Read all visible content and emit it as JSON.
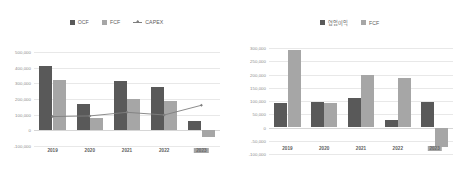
{
  "chart_data": [
    {
      "type": "bar",
      "title": "",
      "xlabel": "",
      "ylabel": "",
      "categories": [
        "2019",
        "2020",
        "2021",
        "2022",
        "2023"
      ],
      "highlight_category": "2023",
      "ylim": [
        -100000,
        500000
      ],
      "yticks": [
        "500,000",
        "400,000",
        "300,000",
        "200,000",
        "100,000",
        "0",
        "-100,000"
      ],
      "ytick_values": [
        500000,
        400000,
        300000,
        200000,
        100000,
        0,
        -100000
      ],
      "grid": true,
      "legend_position": "top-center",
      "series": [
        {
          "name": "OCF",
          "kind": "bar",
          "color": "#595959",
          "values": [
            408000,
            168000,
            318000,
            278000,
            58000
          ]
        },
        {
          "name": "FCF",
          "kind": "bar",
          "color": "#a6a6a6",
          "values": [
            320000,
            78000,
            200000,
            190000,
            -45000
          ]
        },
        {
          "name": "CAPEX",
          "kind": "line",
          "color": "#7f7f7f",
          "values": [
            88000,
            92000,
            115000,
            98000,
            160000
          ]
        }
      ]
    },
    {
      "type": "bar",
      "title": "",
      "xlabel": "",
      "ylabel": "",
      "categories": [
        "2019",
        "2020",
        "2021",
        "2022",
        "2023"
      ],
      "highlight_category": "2023",
      "ylim": [
        -100000,
        300000
      ],
      "yticks": [
        "300,000",
        "250,000",
        "200,000",
        "150,000",
        "100,000",
        "50,000",
        "0",
        "-50,000",
        "-100,000"
      ],
      "ytick_values": [
        300000,
        250000,
        200000,
        150000,
        100000,
        50000,
        0,
        -50000,
        -100000
      ],
      "grid": true,
      "legend_position": "top-center",
      "series": [
        {
          "name": "영업이익",
          "kind": "bar",
          "color": "#595959",
          "values": [
            92000,
            98000,
            113000,
            30000,
            95000
          ]
        },
        {
          "name": "FCF",
          "kind": "bar",
          "color": "#a6a6a6",
          "values": [
            292000,
            92000,
            197000,
            188000,
            -75000
          ]
        }
      ]
    }
  ],
  "left_chart": {
    "legend": [
      {
        "label": "OCF",
        "marker": "square",
        "color": "#595959"
      },
      {
        "label": "FCF",
        "marker": "square",
        "color": "#a6a6a6"
      },
      {
        "label": "CAPEX",
        "marker": "line-diamond",
        "color": "#7f7f7f"
      }
    ]
  },
  "right_chart": {
    "legend": [
      {
        "label": "영업이익",
        "marker": "square",
        "color": "#595959"
      },
      {
        "label": "FCF",
        "marker": "square",
        "color": "#a6a6a6"
      }
    ]
  }
}
